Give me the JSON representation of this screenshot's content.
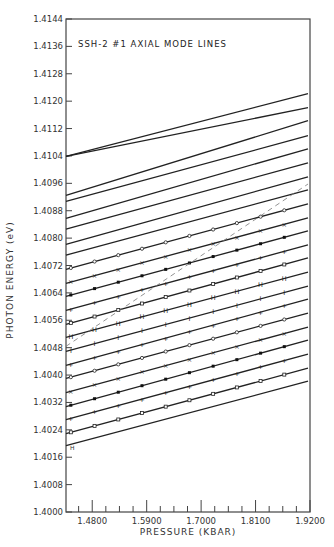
{
  "chart_data": {
    "type": "line",
    "title": "SSH-2 #1   AXIAL MODE LINES",
    "xlabel": "PRESSURE (KBAR)",
    "ylabel": "PHOTON ENERGY (eV)",
    "xlim": [
      1.427,
      1.92
    ],
    "ylim": [
      1.4,
      1.4144
    ],
    "x_ticks": [
      "1.4800",
      "1.5900",
      "1.7000",
      "1.8100",
      "1.9200"
    ],
    "x_tick_values": [
      1.48,
      1.59,
      1.7,
      1.81,
      1.92
    ],
    "y_ticks": [
      "1.4000",
      "1.4008",
      "1.4016",
      "1.4024",
      "1.4032",
      "1.4040",
      "1.4048",
      "1.4056",
      "1.4064",
      "1.4072",
      "1.4080",
      "1.4088",
      "1.4096",
      "1.4104",
      "1.4112",
      "1.4120",
      "1.4128",
      "1.4136",
      "1.4144"
    ],
    "y_tick_values": [
      1.4,
      1.4008,
      1.4016,
      1.4024,
      1.4032,
      1.404,
      1.4048,
      1.4056,
      1.4064,
      1.4072,
      1.408,
      1.4088,
      1.4096,
      1.4104,
      1.4112,
      1.412,
      1.4128,
      1.4136,
      1.4144
    ],
    "grid": false,
    "series": [
      {
        "name": "mode 1",
        "x": [
          1.427,
          1.92
        ],
        "y": [
          1.41039,
          1.41222
        ],
        "marker": "none"
      },
      {
        "name": "mode 2",
        "x": [
          1.427,
          1.92
        ],
        "y": [
          1.41039,
          1.41181
        ],
        "marker": "none"
      },
      {
        "name": "mode 3",
        "x": [
          1.427,
          1.92
        ],
        "y": [
          1.40925,
          1.41143
        ],
        "marker": "none"
      },
      {
        "name": "mode 4",
        "x": [
          1.427,
          1.92
        ],
        "y": [
          1.40907,
          1.41099
        ],
        "marker": "none"
      },
      {
        "name": "mode 5",
        "x": [
          1.427,
          1.92
        ],
        "y": [
          1.40858,
          1.41061
        ],
        "marker": "none"
      },
      {
        "name": "mode 6",
        "x": [
          1.427,
          1.92
        ],
        "y": [
          1.40826,
          1.4102
        ],
        "marker": "none"
      },
      {
        "name": "mode 7",
        "x": [
          1.427,
          1.92
        ],
        "y": [
          1.40782,
          1.40979
        ],
        "marker": "none"
      },
      {
        "name": "mode 8",
        "x": [
          1.427,
          1.92
        ],
        "y": [
          1.4075,
          1.40941
        ],
        "marker": "none"
      },
      {
        "name": "mode 9",
        "x": [
          1.427,
          1.92
        ],
        "y": [
          1.40709,
          1.409
        ],
        "marker": "o"
      },
      {
        "name": "mode 10",
        "x": [
          1.427,
          1.92
        ],
        "y": [
          1.40668,
          1.40859
        ],
        "marker": "x"
      },
      {
        "name": "mode 11",
        "x": [
          1.427,
          1.92
        ],
        "y": [
          1.4063,
          1.40821
        ],
        "marker": "filled"
      },
      {
        "name": "mode 12",
        "x": [
          1.427,
          1.92
        ],
        "y": [
          1.40589,
          1.4078
        ],
        "marker": "plus"
      },
      {
        "name": "mode 13",
        "x": [
          1.427,
          1.92
        ],
        "y": [
          1.40548,
          1.40742
        ],
        "marker": "square"
      },
      {
        "name": "mode 14",
        "x": [
          1.427,
          1.92
        ],
        "y": [
          1.4051,
          1.40701
        ],
        "marker": "H"
      },
      {
        "name": "mode 15",
        "x": [
          1.427,
          1.92
        ],
        "y": [
          1.40469,
          1.4066
        ],
        "marker": "I"
      },
      {
        "name": "mode 16",
        "x": [
          1.427,
          1.92
        ],
        "y": [
          1.40428,
          1.40622
        ],
        "marker": "plus"
      },
      {
        "name": "mode 17",
        "x": [
          1.427,
          1.92
        ],
        "y": [
          1.4039,
          1.40581
        ],
        "marker": "o"
      },
      {
        "name": "mode 18",
        "x": [
          1.427,
          1.92
        ],
        "y": [
          1.40349,
          1.4054
        ],
        "marker": "x"
      },
      {
        "name": "mode 19",
        "x": [
          1.427,
          1.92
        ],
        "y": [
          1.40308,
          1.40502
        ],
        "marker": "filled"
      },
      {
        "name": "mode 20",
        "x": [
          1.427,
          1.92
        ],
        "y": [
          1.4027,
          1.40461
        ],
        "marker": "plus"
      },
      {
        "name": "mode 21",
        "x": [
          1.427,
          1.92
        ],
        "y": [
          1.40229,
          1.4042
        ],
        "marker": "square"
      },
      {
        "name": "mode 22",
        "x": [
          1.427,
          1.92
        ],
        "y": [
          1.40194,
          1.40382
        ],
        "marker": "none"
      },
      {
        "name": "dashed guide",
        "x": [
          1.427,
          1.92
        ],
        "y": [
          1.40484,
          1.40958
        ],
        "marker": "none",
        "dashed": true
      }
    ],
    "annotations": [
      {
        "text": "H",
        "x": 1.435,
        "y": 1.4018
      }
    ]
  }
}
